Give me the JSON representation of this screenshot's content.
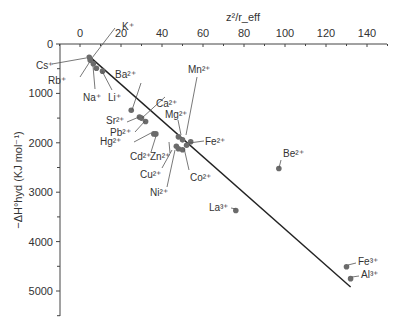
{
  "chart_data": {
    "type": "scatter",
    "title": "",
    "xlabel": "z²/r_eff",
    "ylabel": "−ΔH°hyd (KJ mol⁻¹)",
    "xlim": [
      -5,
      150
    ],
    "ylim": [
      0,
      5500
    ],
    "y_inverted": true,
    "x_axis_position": "top",
    "x_ticks": [
      0,
      20,
      40,
      60,
      80,
      100,
      120,
      140
    ],
    "y_ticks": [
      0,
      1000,
      2000,
      3000,
      4000,
      5000
    ],
    "grid": false,
    "legend": null,
    "points": [
      {
        "label": "Cs⁺",
        "x": 4.5,
        "y": 270
      },
      {
        "label": "K⁺",
        "x": 5,
        "y": 330
      },
      {
        "label": "Rb⁺",
        "x": 6.5,
        "y": 400
      },
      {
        "label": "Na⁺",
        "x": 8,
        "y": 490
      },
      {
        "label": "Li⁺",
        "x": 11,
        "y": 550
      },
      {
        "label": "Ba²⁺",
        "x": 25,
        "y": 1340
      },
      {
        "label": "Sr²⁺",
        "x": 29,
        "y": 1480
      },
      {
        "label": "Ca²⁺",
        "x": 30,
        "y": 1500
      },
      {
        "label": "Pb²⁺",
        "x": 32,
        "y": 1570
      },
      {
        "label": "Hg²⁺",
        "x": 36,
        "y": 1820
      },
      {
        "label": "Cd²⁺",
        "x": 37,
        "y": 1820
      },
      {
        "label": "Mn²⁺",
        "x": 48,
        "y": 1880
      },
      {
        "label": "Mg²⁺",
        "x": 50,
        "y": 1940
      },
      {
        "label": "Fe²⁺",
        "x": 54,
        "y": 1980
      },
      {
        "label": "Zn²⁺",
        "x": 47,
        "y": 2070
      },
      {
        "label": "Cu²⁺",
        "x": 48,
        "y": 2120
      },
      {
        "label": "Co²⁺",
        "x": 52,
        "y": 2050
      },
      {
        "label": "Ni²⁺",
        "x": 50,
        "y": 2140
      },
      {
        "label": "Be²⁺",
        "x": 97,
        "y": 2520
      },
      {
        "label": "La³⁺",
        "x": 76,
        "y": 3370
      },
      {
        "label": "Fe³⁺",
        "x": 130,
        "y": 4510
      },
      {
        "label": "Al³⁺",
        "x": 132,
        "y": 4750
      }
    ],
    "fit_line": {
      "x0": 4,
      "y0": 230,
      "x1": 132,
      "y1": 4920
    }
  }
}
